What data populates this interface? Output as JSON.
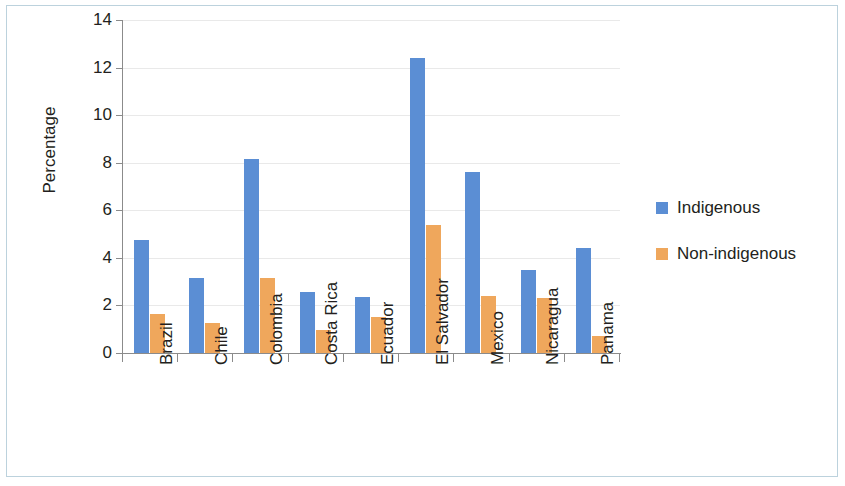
{
  "chart_data": {
    "type": "bar",
    "title": "",
    "subtitle": "",
    "xlabel": "",
    "ylabel": "Percentage",
    "ylim": [
      0,
      14
    ],
    "yticks": [
      0,
      2,
      4,
      6,
      8,
      10,
      12,
      14
    ],
    "ytick_labels": [
      "0",
      "2",
      "4",
      "6",
      "8",
      "10",
      "12",
      "14"
    ],
    "grid": true,
    "grid_axis": "y",
    "legend_position": "right",
    "categories": [
      "Brazil",
      "Chile",
      "Colombia",
      "Costa Rica",
      "Ecuador",
      "El Salvador",
      "Mexico",
      "Nicaragua",
      "Panama"
    ],
    "series": [
      {
        "name": "Indigenous",
        "color": "#5B8ED4",
        "values": [
          4.75,
          3.15,
          8.15,
          2.55,
          2.35,
          12.4,
          7.6,
          3.5,
          4.4
        ]
      },
      {
        "name": "Non-indigenous",
        "color": "#EFA75C",
        "values": [
          1.65,
          1.25,
          3.15,
          0.95,
          1.5,
          5.4,
          2.4,
          2.3,
          0.7
        ]
      }
    ]
  },
  "legend": {
    "entries": [
      {
        "label": "Indigenous",
        "color": "#5B8ED4"
      },
      {
        "label": "Non-indigenous",
        "color": "#EFA75C"
      }
    ]
  }
}
